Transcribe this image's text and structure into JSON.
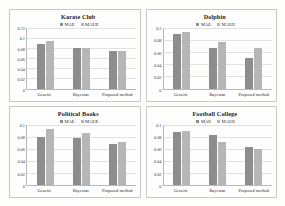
{
  "figure": {
    "background": "#fdfdfc",
    "series_colors": {
      "MAE": "#8d8d8d",
      "MAUE": "#b6b6b6"
    }
  },
  "chart_data": [
    {
      "type": "bar",
      "title": "Karate Club",
      "xlabel": "",
      "ylabel": "",
      "categories": [
        "Genetic",
        "Bayesian",
        "Proposed method"
      ],
      "series": [
        {
          "name": "MAE",
          "values": [
            0.0885,
            0.08,
            0.0735
          ]
        },
        {
          "name": "MAUE",
          "values": [
            0.0945,
            0.08,
            0.0735
          ]
        }
      ],
      "ylim": [
        0,
        0.12
      ],
      "yticks": [
        "0.12",
        "0.1",
        "0.08",
        "0.06",
        "0.04",
        "0.02",
        "0"
      ],
      "ytick_values": [
        0.12,
        0.1,
        0.08,
        0.06,
        0.04,
        0.02,
        0
      ],
      "grid": true,
      "legend_position": "top-center"
    },
    {
      "type": "bar",
      "title": "Dolphin",
      "xlabel": "",
      "ylabel": "",
      "categories": [
        "Genetic",
        "Bayesian",
        "Proposed method"
      ],
      "series": [
        {
          "name": "MAE",
          "values": [
            0.0895,
            0.0665,
            0.05
          ]
        },
        {
          "name": "MAUE",
          "values": [
            0.094,
            0.0775,
            0.0665
          ]
        }
      ],
      "ylim": [
        0,
        0.1
      ],
      "yticks": [
        "0.1",
        "0.08",
        "0.06",
        "0.04",
        "0.02",
        "0"
      ],
      "ytick_values": [
        0.1,
        0.08,
        0.06,
        0.04,
        0.02,
        0
      ],
      "grid": true,
      "legend_position": "top-center"
    },
    {
      "type": "bar",
      "title": "Political Books",
      "xlabel": "",
      "ylabel": "",
      "categories": [
        "Genetic",
        "Bayesian",
        "Proposed method"
      ],
      "series": [
        {
          "name": "MAE",
          "values": [
            0.079,
            0.0775,
            0.0685
          ]
        },
        {
          "name": "MAUE",
          "values": [
            0.092,
            0.0855,
            0.071
          ]
        }
      ],
      "ylim": [
        0,
        0.1
      ],
      "yticks": [
        "0.1",
        "0.08",
        "0.06",
        "0.04",
        "0.02",
        "0"
      ],
      "ytick_values": [
        0.1,
        0.08,
        0.06,
        0.04,
        0.02,
        0
      ],
      "grid": true,
      "legend_position": "top-center"
    },
    {
      "type": "bar",
      "title": "Football College",
      "xlabel": "",
      "ylabel": "",
      "categories": [
        "Genetic",
        "Bayesian",
        "Proposed method"
      ],
      "series": [
        {
          "name": "MAE",
          "values": [
            0.088,
            0.082,
            0.0625
          ]
        },
        {
          "name": "MAUE",
          "values": [
            0.0885,
            0.0705,
            0.059
          ]
        }
      ],
      "ylim": [
        0,
        0.1
      ],
      "yticks": [
        "0.1",
        "0.08",
        "0.06",
        "0.04",
        "0.02",
        "0"
      ],
      "ytick_values": [
        0.1,
        0.08,
        0.06,
        0.04,
        0.02,
        0
      ],
      "grid": true,
      "legend_position": "top-center"
    }
  ]
}
